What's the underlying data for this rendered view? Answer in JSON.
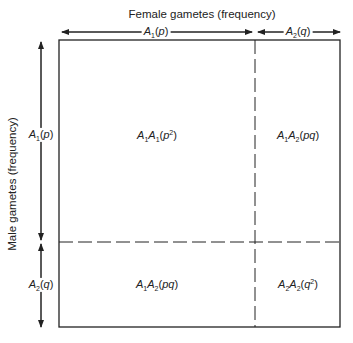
{
  "diagram": {
    "top_title": "Female gametes (frequency)",
    "side_title": "Male gametes (frequency)",
    "female_alleles": [
      {
        "allele": "A",
        "sub": "1",
        "freq": "p"
      },
      {
        "allele": "A",
        "sub": "2",
        "freq": "q"
      }
    ],
    "male_alleles": [
      {
        "allele": "A",
        "sub": "1",
        "freq": "p"
      },
      {
        "allele": "A",
        "sub": "2",
        "freq": "q"
      }
    ],
    "cells": [
      {
        "genotype_a": "A",
        "sub_a": "1",
        "genotype_b": "A",
        "sub_b": "1",
        "freq": "p",
        "sup": "2"
      },
      {
        "genotype_a": "A",
        "sub_a": "1",
        "genotype_b": "A",
        "sub_b": "2",
        "freq": "pq",
        "sup": ""
      },
      {
        "genotype_a": "A",
        "sub_a": "1",
        "genotype_b": "A",
        "sub_b": "2",
        "freq": "pq",
        "sup": ""
      },
      {
        "genotype_a": "A",
        "sub_a": "2",
        "genotype_b": "A",
        "sub_b": "2",
        "freq": "q",
        "sup": "2"
      }
    ],
    "colors": {
      "line": "#222222",
      "background": "#ffffff"
    }
  }
}
